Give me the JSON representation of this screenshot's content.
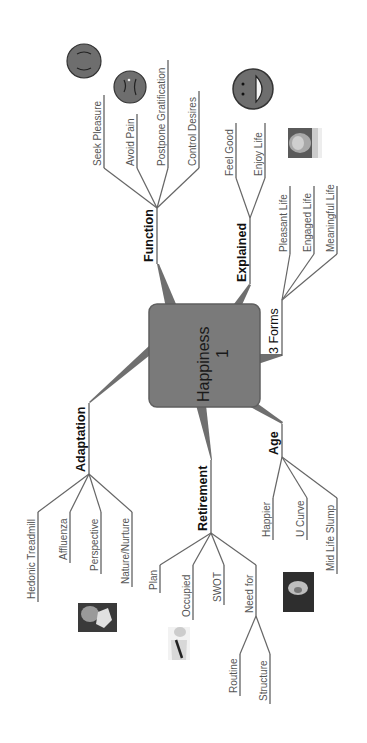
{
  "central": {
    "title": "Happiness",
    "number": "1",
    "fill": "#7a7a7a",
    "border": "#5a5a5a"
  },
  "branches": {
    "function": {
      "label": "Function",
      "children": [
        "Seek Pleasure",
        "Avoid Pain",
        "Postpone Gratification",
        "Control Desires"
      ]
    },
    "explained": {
      "label": "Explained",
      "children": [
        "Feel Good",
        "Enjoy Life"
      ]
    },
    "forms": {
      "label": "3 Forms",
      "children": [
        "Pleasant Life",
        "Engaged Life",
        "Meaningful Life"
      ]
    },
    "adaptation": {
      "label": "Adaptation",
      "children": [
        "Hedonic Treadmill",
        "Affluenza",
        "Perspective",
        "Nature/Nurture"
      ]
    },
    "retirement": {
      "label": "Retirement",
      "children": [
        "Plan",
        "Occupied",
        "SWOT",
        "Need for"
      ],
      "need_for_children": [
        "Routine",
        "Structure"
      ]
    },
    "age": {
      "label": "Age",
      "children": [
        "Happier",
        "U Curve",
        "Mid Life Slump"
      ]
    }
  },
  "icons": {
    "smiley_neutral": "neutral-face-icon",
    "smiley_sad": "sad-face-icon",
    "smiley_happy": "happy-face-icon",
    "photo_explained": "portrait-photo",
    "photo_adaptation": "abstract-photo",
    "photo_retirement": "person-photo",
    "photo_age": "portrait-photo"
  },
  "colors": {
    "line": "#666666",
    "smiley_fill": "#6e6e6e",
    "label_text": "#555555"
  }
}
